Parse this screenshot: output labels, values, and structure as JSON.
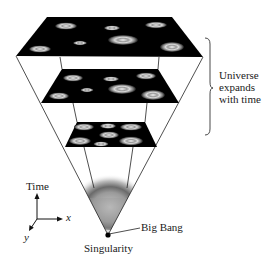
{
  "figure": {
    "labels": {
      "universe_expands": [
        "Universe",
        "expands",
        "with time"
      ],
      "big_bang": "Big Bang",
      "singularity": "Singularity",
      "axis_time": "Time",
      "axis_x": "x",
      "axis_y": "y"
    },
    "colors": {
      "plane": "#000000",
      "line": "#222222",
      "background": "#ffffff",
      "galaxy": "#e8e8e8"
    },
    "planes": [
      {
        "name": "latest",
        "galaxies": 7
      },
      {
        "name": "middle",
        "galaxies": 7
      },
      {
        "name": "earliest",
        "galaxies": 7
      }
    ]
  }
}
